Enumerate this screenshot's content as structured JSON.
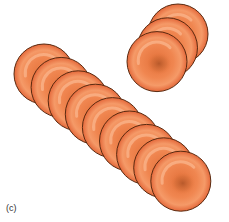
{
  "figure": {
    "panel_label": "(c)"
  },
  "colors": {
    "cell_fill": "#ee7a40",
    "cell_light": "#f7a070",
    "cell_dark": "#d8602a",
    "cell_outline": "#5a2a10",
    "center_dimple": "#b5582a",
    "background": "#ffffff"
  },
  "stacks": [
    {
      "name": "long-stack",
      "cell_count": 9,
      "start": {
        "cx": 44,
        "cy": 74
      },
      "step": {
        "dx": 17.1,
        "dy": 13.4
      },
      "radius": 30
    },
    {
      "name": "short-stack",
      "cell_count": 3,
      "start": {
        "cx": 178,
        "cy": 34
      },
      "step": {
        "dx": -10.5,
        "dy": 13.8
      },
      "radius": 30
    }
  ]
}
